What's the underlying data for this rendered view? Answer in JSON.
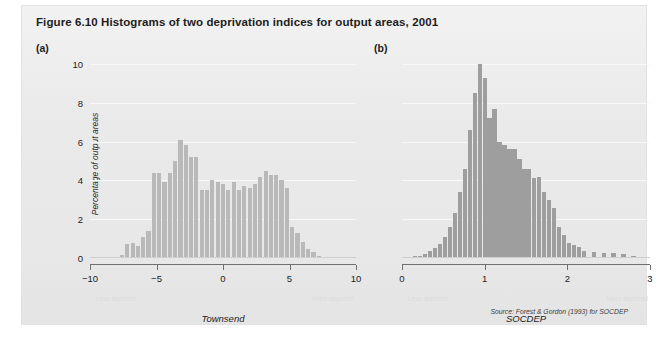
{
  "figure": {
    "title": "Figure 6.10  Histograms of two deprivation indices for output areas, 2001",
    "source": "Source: Forest & Gordon (1993) for SOCDEP",
    "panel_a_label": "(a)",
    "panel_b_label": "(b)",
    "bar_color_a": "#b9b9b9",
    "bar_color_b": "#9e9e9e",
    "background_color": "#ececec"
  },
  "annotations": {
    "less_deprived": "Less deprived",
    "more_deprived": "More deprived"
  },
  "chart_data": [
    {
      "type": "bar",
      "panel": "(a)",
      "title": "",
      "xlabel": "Townsend",
      "ylabel": "Percentage of output areas",
      "xlim": [
        -10,
        10
      ],
      "ylim": [
        0,
        10
      ],
      "yticks": [
        0,
        2,
        4,
        6,
        8,
        10
      ],
      "xticks": [
        -10,
        -5,
        0,
        5,
        10
      ],
      "grid": true,
      "x": [
        -7.6,
        -7.2,
        -6.8,
        -6.4,
        -6.0,
        -5.6,
        -5.2,
        -4.8,
        -4.4,
        -4.0,
        -3.6,
        -3.2,
        -2.8,
        -2.4,
        -2.0,
        -1.6,
        -1.2,
        -0.8,
        -0.4,
        0.0,
        0.4,
        0.8,
        1.2,
        1.6,
        2.0,
        2.4,
        2.8,
        3.2,
        3.6,
        4.0,
        4.4,
        4.8,
        5.2,
        5.6,
        6.0,
        6.4,
        6.8,
        7.2,
        7.6
      ],
      "values": [
        0.15,
        0.7,
        0.75,
        0.6,
        1.1,
        1.4,
        4.4,
        4.4,
        3.9,
        4.4,
        5.0,
        6.1,
        5.8,
        5.2,
        5.2,
        3.5,
        3.5,
        4.0,
        3.9,
        3.8,
        3.5,
        3.9,
        3.5,
        3.7,
        3.6,
        3.8,
        4.2,
        4.5,
        4.3,
        4.3,
        4.0,
        3.6,
        1.6,
        1.3,
        0.8,
        0.45,
        0.3,
        0.12,
        0.05
      ]
    },
    {
      "type": "bar",
      "panel": "(b)",
      "title": "",
      "xlabel": "SOCDEP",
      "ylabel": "Percentage of output areas",
      "xlim": [
        0,
        3
      ],
      "ylim": [
        0,
        10
      ],
      "yticks": [
        0,
        2,
        4,
        6,
        8,
        10
      ],
      "xticks": [
        0,
        1,
        2,
        3
      ],
      "grid": true,
      "x": [
        0.1,
        0.16,
        0.22,
        0.28,
        0.34,
        0.4,
        0.46,
        0.52,
        0.58,
        0.64,
        0.7,
        0.76,
        0.82,
        0.88,
        0.94,
        1.0,
        1.06,
        1.12,
        1.18,
        1.24,
        1.3,
        1.36,
        1.42,
        1.48,
        1.54,
        1.6,
        1.66,
        1.72,
        1.78,
        1.84,
        1.9,
        1.96,
        2.02,
        2.08,
        2.14,
        2.2,
        2.32,
        2.44,
        2.56,
        2.68,
        2.8
      ],
      "values": [
        0.05,
        0.08,
        0.12,
        0.2,
        0.35,
        0.5,
        0.7,
        1.1,
        1.6,
        2.3,
        3.4,
        4.6,
        6.6,
        8.5,
        10.0,
        9.3,
        7.2,
        7.7,
        6.0,
        5.8,
        5.6,
        5.6,
        5.1,
        4.6,
        4.6,
        4.1,
        4.2,
        3.4,
        3.0,
        2.6,
        1.6,
        1.2,
        0.75,
        0.65,
        0.55,
        0.35,
        0.3,
        0.28,
        0.25,
        0.2,
        0.1
      ]
    }
  ]
}
